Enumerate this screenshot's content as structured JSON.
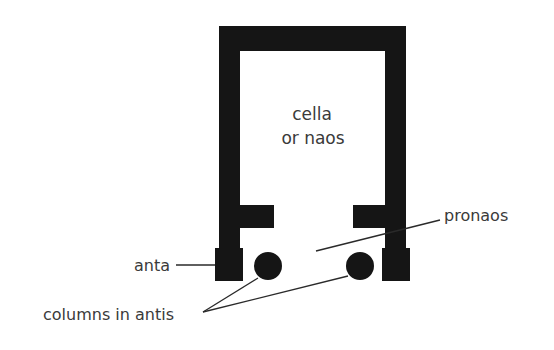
{
  "diagram": {
    "colors": {
      "wall": "#151515",
      "text": "#3a3a3a",
      "leader": "#2a2a2a",
      "background": "#ffffff"
    },
    "labels": {
      "cella_line1": "cella",
      "cella_line2": "or naos",
      "pronaos": "pronaos",
      "anta": "anta",
      "columns": "columns in antis"
    }
  }
}
